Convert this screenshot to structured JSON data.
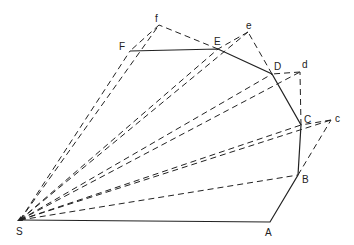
{
  "diagram": {
    "type": "geometric construction",
    "colors": {
      "stroke": "#222222",
      "background": "#ffffff"
    },
    "points": [
      {
        "id": "S",
        "label": "S",
        "x": 20,
        "y": 220,
        "lx": 16,
        "ly": 227
      },
      {
        "id": "A",
        "label": "A",
        "x": 270,
        "y": 222,
        "lx": 265,
        "ly": 228
      },
      {
        "id": "B",
        "label": "B",
        "x": 298,
        "y": 175,
        "lx": 302,
        "ly": 175
      },
      {
        "id": "C",
        "label": "C",
        "x": 301,
        "y": 125,
        "lx": 304,
        "ly": 115
      },
      {
        "id": "c",
        "label": "c",
        "x": 331,
        "y": 120,
        "lx": 335,
        "ly": 114
      },
      {
        "id": "D",
        "label": "D",
        "x": 272,
        "y": 74,
        "lx": 274,
        "ly": 62
      },
      {
        "id": "d",
        "label": "d",
        "x": 300,
        "y": 72,
        "lx": 302,
        "ly": 60
      },
      {
        "id": "E",
        "label": "E",
        "x": 218,
        "y": 49,
        "lx": 214,
        "ly": 37
      },
      {
        "id": "e",
        "label": "e",
        "x": 248,
        "y": 32,
        "lx": 246,
        "ly": 21
      },
      {
        "id": "F",
        "label": "F",
        "x": 130,
        "y": 51,
        "lx": 119,
        "ly": 42
      },
      {
        "id": "f",
        "label": "f",
        "x": 159,
        "y": 25,
        "lx": 155,
        "ly": 14
      }
    ],
    "solid_polyline": [
      "S",
      "A",
      "B",
      "C",
      "D",
      "E",
      "F"
    ],
    "dashed_segments": [
      [
        "S",
        "B"
      ],
      [
        "S",
        "C"
      ],
      [
        "S",
        "c"
      ],
      [
        "S",
        "D"
      ],
      [
        "S",
        "d"
      ],
      [
        "S",
        "E"
      ],
      [
        "S",
        "e"
      ],
      [
        "S",
        "F"
      ],
      [
        "S",
        "f"
      ],
      [
        "B",
        "c"
      ],
      [
        "c",
        "C"
      ],
      [
        "C",
        "d"
      ],
      [
        "d",
        "D"
      ],
      [
        "D",
        "e"
      ],
      [
        "e",
        "E"
      ],
      [
        "E",
        "f"
      ],
      [
        "f",
        "F"
      ]
    ]
  }
}
